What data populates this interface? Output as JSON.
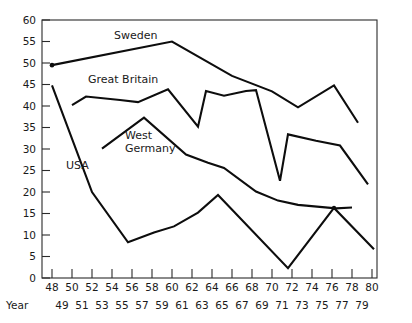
{
  "chart_data": {
    "type": "line",
    "title": "",
    "subtitle": "",
    "xlabel": "Year",
    "ylabel": "",
    "xlim": [
      47,
      80.5
    ],
    "ylim": [
      0,
      60
    ],
    "grid": false,
    "legend": "inline-labels",
    "y_ticks": [
      0,
      5,
      10,
      15,
      20,
      25,
      30,
      35,
      40,
      45,
      50,
      55,
      60
    ],
    "y_tick_labels": [
      "0",
      "5",
      "10",
      "15",
      "20",
      "25",
      "30",
      "35",
      "40",
      "45",
      "50",
      "55",
      "60"
    ],
    "x_ticks_upper": [
      48,
      50,
      52,
      54,
      56,
      58,
      60,
      62,
      64,
      66,
      68,
      70,
      72,
      74,
      76,
      78,
      80
    ],
    "x_tick_labels_upper": [
      "48",
      "50",
      "52",
      "54",
      "56",
      "58",
      "60",
      "62",
      "64",
      "66",
      "68",
      "70",
      "72",
      "74",
      "76",
      "78",
      "80"
    ],
    "x_ticks_lower": [
      49,
      51,
      53,
      55,
      57,
      59,
      61,
      63,
      65,
      67,
      69,
      71,
      73,
      75,
      77,
      79
    ],
    "x_tick_labels_lower": [
      "49",
      "51",
      "53",
      "55",
      "57",
      "59",
      "61",
      "63",
      "65",
      "67",
      "69",
      "71",
      "73",
      "75",
      "77",
      "79"
    ],
    "series": [
      {
        "name": "Sweden",
        "label": "Sweden",
        "label_x": 54.2,
        "label_y": 55.6,
        "marker_at_start": true,
        "points": [
          [
            48,
            49.5
          ],
          [
            60,
            55.0
          ],
          [
            66,
            47.0
          ],
          [
            70,
            43.4
          ],
          [
            72.6,
            39.7
          ],
          [
            76.2,
            44.8
          ],
          [
            78.6,
            36.1
          ]
        ]
      },
      {
        "name": "Great Britain",
        "label": "Great Britain",
        "label_x": 51.6,
        "label_y": 45.3,
        "marker_at_start": false,
        "points": [
          [
            50,
            40.2
          ],
          [
            51.4,
            42.2
          ],
          [
            54.8,
            41.4
          ],
          [
            56.6,
            40.9
          ],
          [
            59.6,
            43.9
          ],
          [
            62.6,
            35.2
          ],
          [
            63.4,
            43.5
          ],
          [
            65.2,
            42.4
          ],
          [
            67.4,
            43.5
          ],
          [
            68.4,
            43.7
          ],
          [
            70.8,
            22.6
          ],
          [
            71.6,
            33.4
          ],
          [
            74.4,
            31.9
          ],
          [
            76.8,
            30.8
          ],
          [
            79.6,
            21.8
          ]
        ]
      },
      {
        "name": "West Germany",
        "label": "West\nGermany",
        "label_x": 55.3,
        "label_y": 32.4,
        "marker_at_start": false,
        "points": [
          [
            53.0,
            30.1
          ],
          [
            57.2,
            37.3
          ],
          [
            61.4,
            28.7
          ],
          [
            63.6,
            26.8
          ],
          [
            65.2,
            25.6
          ],
          [
            68.4,
            20.1
          ],
          [
            70.6,
            18.0
          ],
          [
            72.6,
            17.0
          ],
          [
            76.4,
            16.2
          ],
          [
            78.0,
            16.4
          ]
        ]
      },
      {
        "name": "USA",
        "label": "USA",
        "label_x": 49.4,
        "label_y": 25.4,
        "marker_at_start": false,
        "points": [
          [
            48.0,
            44.8
          ],
          [
            52.0,
            20.0
          ],
          [
            55.6,
            8.3
          ],
          [
            58.2,
            10.6
          ],
          [
            60.2,
            12.0
          ],
          [
            62.6,
            15.2
          ],
          [
            64.6,
            19.3
          ],
          [
            71.6,
            2.3
          ],
          [
            76.2,
            16.3
          ],
          [
            80.2,
            6.7
          ]
        ]
      }
    ]
  }
}
